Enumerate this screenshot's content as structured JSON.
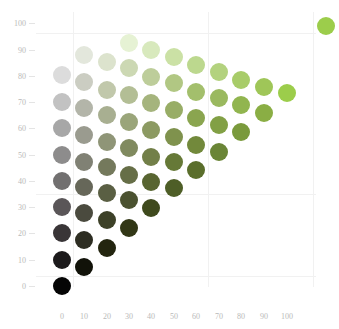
{
  "chart_data": {
    "type": "scatter",
    "title": "",
    "xlabel": "",
    "ylabel": "",
    "xlim": [
      0,
      100
    ],
    "ylim": [
      0,
      100
    ],
    "grid": true,
    "legend": "none",
    "x_ticks": [
      "0",
      "10",
      "20",
      "30",
      "40",
      "50",
      "60",
      "70",
      "80",
      "90",
      "100"
    ],
    "y_ticks": [
      "100",
      "90",
      "80",
      "70",
      "60",
      "50",
      "40",
      "30",
      "20",
      "10",
      "0"
    ],
    "accent_color": "#9ccc4c",
    "columns": [
      {
        "x": 0,
        "count": 9
      },
      {
        "x": 10,
        "count": 9
      },
      {
        "x": 20,
        "count": 8
      },
      {
        "x": 30,
        "count": 8
      },
      {
        "x": 40,
        "count": 7
      },
      {
        "x": 50,
        "count": 6
      },
      {
        "x": 60,
        "count": 5
      },
      {
        "x": 70,
        "count": 4
      },
      {
        "x": 80,
        "count": 3
      },
      {
        "x": 90,
        "count": 2
      },
      {
        "x": 100,
        "count": 1
      }
    ],
    "extra_swatch": {
      "color": "#9ccd4b",
      "position": "top-right"
    }
  },
  "axes": {
    "y_ticks": [
      {
        "label": "100",
        "y": 23
      },
      {
        "label": "90",
        "y": 50
      },
      {
        "label": "80",
        "y": 76
      },
      {
        "label": "70",
        "y": 102
      },
      {
        "label": "60",
        "y": 128
      },
      {
        "label": "50",
        "y": 155
      },
      {
        "label": "40",
        "y": 181
      },
      {
        "label": "30",
        "y": 207
      },
      {
        "label": "20",
        "y": 233
      },
      {
        "label": "10",
        "y": 260
      },
      {
        "label": "0",
        "y": 286
      }
    ],
    "x_ticks": [
      {
        "label": "0",
        "x": 62
      },
      {
        "label": "10",
        "x": 84
      },
      {
        "label": "20",
        "x": 107
      },
      {
        "label": "30",
        "x": 129
      },
      {
        "label": "40",
        "x": 151
      },
      {
        "label": "50",
        "x": 174
      },
      {
        "label": "60",
        "x": 196
      },
      {
        "label": "70",
        "x": 219
      },
      {
        "label": "80",
        "x": 241
      },
      {
        "label": "90",
        "x": 264
      },
      {
        "label": "100",
        "x": 287
      }
    ]
  },
  "swatches": [
    {
      "cx": 62,
      "cy": 286,
      "color": "#050505"
    },
    {
      "cx": 62,
      "cy": 260,
      "color": "#1c1a1b"
    },
    {
      "cx": 62,
      "cy": 233,
      "color": "#393537"
    },
    {
      "cx": 62,
      "cy": 207,
      "color": "#5a5658"
    },
    {
      "cx": 62,
      "cy": 181,
      "color": "#727070"
    },
    {
      "cx": 62,
      "cy": 155,
      "color": "#8d8c8c"
    },
    {
      "cx": 62,
      "cy": 128,
      "color": "#a7a7a7"
    },
    {
      "cx": 62,
      "cy": 102,
      "color": "#c2c2c2"
    },
    {
      "cx": 62,
      "cy": 75,
      "color": "#dcdcdc"
    },
    {
      "cx": 84,
      "cy": 267,
      "color": "#111209"
    },
    {
      "cx": 84,
      "cy": 240,
      "color": "#2d2d22"
    },
    {
      "cx": 84,
      "cy": 213,
      "color": "#4a4a3e"
    },
    {
      "cx": 84,
      "cy": 187,
      "color": "#666759"
    },
    {
      "cx": 84,
      "cy": 162,
      "color": "#808174"
    },
    {
      "cx": 84,
      "cy": 135,
      "color": "#9a9b8f"
    },
    {
      "cx": 84,
      "cy": 108,
      "color": "#b3b5a9"
    },
    {
      "cx": 84,
      "cy": 82,
      "color": "#cbcdc2"
    },
    {
      "cx": 84,
      "cy": 55,
      "color": "#e3e7dc"
    },
    {
      "cx": 107,
      "cy": 248,
      "color": "#23250f"
    },
    {
      "cx": 107,
      "cy": 220,
      "color": "#3d4128"
    },
    {
      "cx": 107,
      "cy": 193,
      "color": "#5a5f43"
    },
    {
      "cx": 107,
      "cy": 167,
      "color": "#74795c"
    },
    {
      "cx": 107,
      "cy": 142,
      "color": "#8f9577"
    },
    {
      "cx": 107,
      "cy": 115,
      "color": "#a8af91"
    },
    {
      "cx": 107,
      "cy": 90,
      "color": "#c1c8ab"
    },
    {
      "cx": 107,
      "cy": 62,
      "color": "#dce3cd"
    },
    {
      "cx": 129,
      "cy": 228,
      "color": "#323716"
    },
    {
      "cx": 129,
      "cy": 200,
      "color": "#4b5230"
    },
    {
      "cx": 129,
      "cy": 175,
      "color": "#666e47"
    },
    {
      "cx": 129,
      "cy": 148,
      "color": "#808a5f"
    },
    {
      "cx": 129,
      "cy": 122,
      "color": "#9aa57a"
    },
    {
      "cx": 129,
      "cy": 95,
      "color": "#b3be95"
    },
    {
      "cx": 129,
      "cy": 68,
      "color": "#ccd8b3"
    },
    {
      "cx": 129,
      "cy": 43,
      "color": "#e6f2d4"
    },
    {
      "cx": 151,
      "cy": 208,
      "color": "#3f4a1d"
    },
    {
      "cx": 151,
      "cy": 182,
      "color": "#586531"
    },
    {
      "cx": 151,
      "cy": 157,
      "color": "#727f48"
    },
    {
      "cx": 151,
      "cy": 130,
      "color": "#8c9a62"
    },
    {
      "cx": 151,
      "cy": 103,
      "color": "#a5b47d"
    },
    {
      "cx": 151,
      "cy": 77,
      "color": "#bdcd9a"
    },
    {
      "cx": 151,
      "cy": 50,
      "color": "#d8e9bd"
    },
    {
      "cx": 174,
      "cy": 188,
      "color": "#4e5e27"
    },
    {
      "cx": 174,
      "cy": 162,
      "color": "#667937"
    },
    {
      "cx": 174,
      "cy": 137,
      "color": "#7f924d"
    },
    {
      "cx": 174,
      "cy": 110,
      "color": "#98ad66"
    },
    {
      "cx": 174,
      "cy": 83,
      "color": "#b1c783"
    },
    {
      "cx": 174,
      "cy": 57,
      "color": "#cbe1a5"
    },
    {
      "cx": 196,
      "cy": 170,
      "color": "#5a6e2b"
    },
    {
      "cx": 196,
      "cy": 145,
      "color": "#72893b"
    },
    {
      "cx": 196,
      "cy": 118,
      "color": "#8aa54f"
    },
    {
      "cx": 196,
      "cy": 92,
      "color": "#a3bf6c"
    },
    {
      "cx": 196,
      "cy": 65,
      "color": "#bcd88e"
    },
    {
      "cx": 219,
      "cy": 152,
      "color": "#6a8536"
    },
    {
      "cx": 219,
      "cy": 125,
      "color": "#82a045"
    },
    {
      "cx": 219,
      "cy": 98,
      "color": "#9ab95f"
    },
    {
      "cx": 219,
      "cy": 72,
      "color": "#b3d27e"
    },
    {
      "cx": 241,
      "cy": 132,
      "color": "#7a9a3c"
    },
    {
      "cx": 241,
      "cy": 105,
      "color": "#91b54f"
    },
    {
      "cx": 241,
      "cy": 80,
      "color": "#a8cc69"
    },
    {
      "cx": 264,
      "cy": 113,
      "color": "#8aae44"
    },
    {
      "cx": 264,
      "cy": 87,
      "color": "#9fc658"
    },
    {
      "cx": 287,
      "cy": 93,
      "color": "#9ccd4b"
    },
    {
      "cx": 326,
      "cy": 26,
      "color": "#9ccd4b"
    }
  ]
}
